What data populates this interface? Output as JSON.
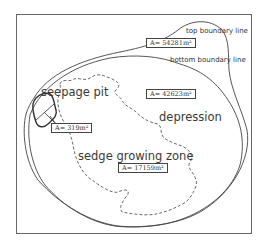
{
  "diagram": {
    "labels": {
      "top_boundary": "top boundary line",
      "bottom_boundary": "bottom boundary line",
      "seepage_pit": "seepage pit",
      "depression": "depression",
      "sedge_zone": "sedge growing zone"
    },
    "areas": {
      "top": "A= 54281m²",
      "depression": "A= 42623m²",
      "seepage_pit": "A= 319m²",
      "sedge_zone": "A= 17159m²"
    },
    "colors": {
      "line": "#444444",
      "frame": "#666666",
      "text": "#333333"
    }
  }
}
